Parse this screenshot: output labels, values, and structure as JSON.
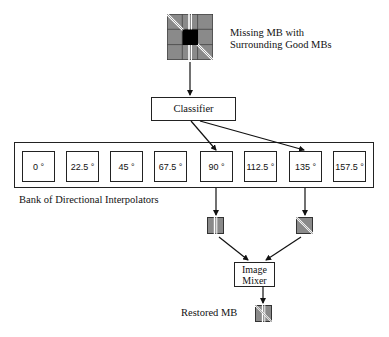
{
  "diagram": {
    "input_label_line1": "Missing MB with",
    "input_label_line2": "Surrounding Good MBs",
    "classifier_label": "Classifier",
    "bank_label": "Bank of Directional Interpolators",
    "interpolators": [
      {
        "label": "0 °"
      },
      {
        "label": "22.5 °"
      },
      {
        "label": "45 °"
      },
      {
        "label": "67.5 °"
      },
      {
        "label": "90 °"
      },
      {
        "label": "112.5 °"
      },
      {
        "label": "135 °"
      },
      {
        "label": "157.5 °"
      }
    ],
    "selected_interpolators": [
      "90 °",
      "135 °"
    ],
    "mixer_label_line1": "Image",
    "mixer_label_line2": "Mixer",
    "output_label": "Restored MB"
  },
  "colors": {
    "line": "#222222",
    "block_gray": "#8a8a8a",
    "missing_block": "#000000",
    "background": "#ffffff"
  }
}
